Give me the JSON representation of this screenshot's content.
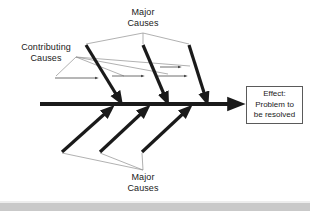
{
  "diagram": {
    "type": "fishbone-ishikawa",
    "title_labels": {
      "major_causes_top": {
        "line1": "Major",
        "line2": "Causes"
      },
      "contributing_causes": {
        "line1": "Contributing",
        "line2": "Causes"
      },
      "major_causes_bottom": {
        "line1": "Major",
        "line2": "Causes"
      }
    },
    "effect_box": {
      "line1": "Effect:",
      "line2": "Problem to",
      "line3": "be resolved"
    },
    "colors": {
      "spine": "#1a1a1a",
      "major_bone": "#1a1a1a",
      "contributing_arrow": "#5a5a5a",
      "leader_line": "#8a8a8a",
      "box_border": "#5a5a5a",
      "background": "#ffffff",
      "bottom_strip": "#c9c9c9",
      "text": "#1a1a1a"
    },
    "geometry": {
      "spine": {
        "x1": 40,
        "y1": 104,
        "x2": 240,
        "y2": 104,
        "stroke_width": 4
      },
      "major_bones_top": [
        {
          "x1": 86,
          "y1": 45,
          "x2": 120,
          "y2": 101
        },
        {
          "x1": 143,
          "y1": 45,
          "x2": 167,
          "y2": 101
        },
        {
          "x1": 188,
          "y1": 45,
          "x2": 207,
          "y2": 101
        }
      ],
      "major_bones_bottom": [
        {
          "x1": 62,
          "y1": 152,
          "x2": 110,
          "y2": 107
        },
        {
          "x1": 100,
          "y1": 152,
          "x2": 146,
          "y2": 107
        },
        {
          "x1": 142,
          "y1": 152,
          "x2": 188,
          "y2": 107
        }
      ],
      "contributing_arrows": [
        {
          "x1": 55,
          "y1": 78,
          "x2": 99,
          "y2": 78
        },
        {
          "x1": 112,
          "y1": 76,
          "x2": 145,
          "y2": 76
        },
        {
          "x1": 160,
          "y1": 76,
          "x2": 188,
          "y2": 76
        },
        {
          "x1": 160,
          "y1": 68,
          "x2": 182,
          "y2": 68
        }
      ]
    }
  }
}
